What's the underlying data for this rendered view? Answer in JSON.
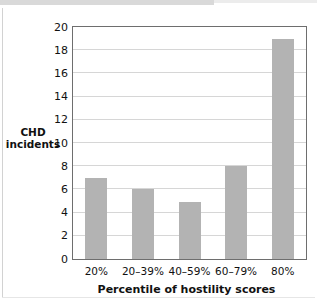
{
  "chart_data": {
    "type": "bar",
    "title": "",
    "subtitle": "",
    "xlabel": "Percentile of hostility scores",
    "ylabel": "CHD incidents",
    "ylabel_lines": [
      "CHD",
      "incidents"
    ],
    "categories": [
      "20%",
      "20–39%",
      "40–59%",
      "60–79%",
      "80%"
    ],
    "values": [
      7,
      6,
      4.9,
      8,
      19
    ],
    "ylim": [
      0,
      20
    ],
    "ytick_labels": [
      "0",
      "2",
      "4",
      "6",
      "8",
      "10",
      "12",
      "14",
      "16",
      "18",
      "20"
    ],
    "ytick_values": [
      0,
      2,
      4,
      6,
      8,
      10,
      12,
      14,
      16,
      18,
      20
    ],
    "grid": "horizontal",
    "legend": "none",
    "bar_color": "#b3b3b3",
    "grid_color": "#d6d6d6",
    "frame_color": "#6e6e6e",
    "background": "#ffffff"
  }
}
